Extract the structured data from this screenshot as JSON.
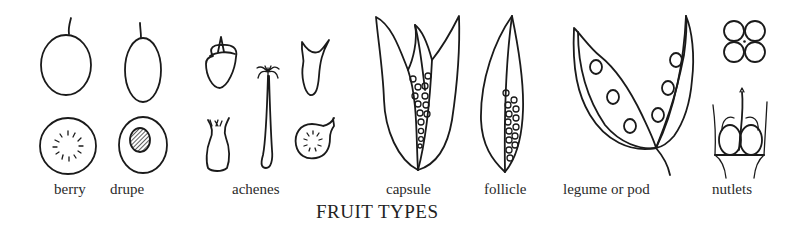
{
  "title": "FRUIT TYPES",
  "fruits": [
    {
      "id": "berry",
      "label": "berry"
    },
    {
      "id": "drupe",
      "label": "drupe"
    },
    {
      "id": "achenes",
      "label": "achenes"
    },
    {
      "id": "capsule",
      "label": "capsule"
    },
    {
      "id": "follicle",
      "label": "follicle"
    },
    {
      "id": "legume",
      "label": "legume or pod"
    },
    {
      "id": "nutlets",
      "label": "nutlets"
    }
  ],
  "colors": {
    "ink": "#1a1a1a",
    "background": "#ffffff"
  }
}
